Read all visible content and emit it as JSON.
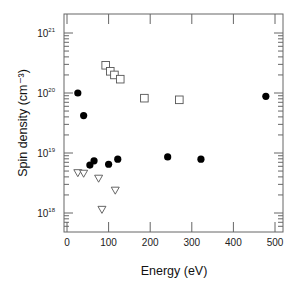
{
  "chart_data": {
    "type": "scatter",
    "title": "",
    "xlabel": "Energy (eV)",
    "ylabel": "Spin density (cm⁻³)",
    "xlim": [
      -10,
      510
    ],
    "ylim_log10": [
      17.7,
      21.3
    ],
    "yscale": "log",
    "grid": false,
    "legend": "none",
    "x_ticks": [
      0,
      100,
      200,
      300,
      400,
      500
    ],
    "y_ticks": [
      {
        "exp": 18,
        "label": "10",
        "sup": "18"
      },
      {
        "exp": 19,
        "label": "10",
        "sup": "19"
      },
      {
        "exp": 20,
        "label": "10",
        "sup": "20"
      },
      {
        "exp": 21,
        "label": "10",
        "sup": "21"
      }
    ],
    "series": [
      {
        "name": "filled-circles",
        "marker": "circle-filled",
        "color": "#000000",
        "points": [
          {
            "x": 26,
            "y": 1e+20
          },
          {
            "x": 40,
            "y": 4.2e+19
          },
          {
            "x": 55,
            "y": 6.3e+18
          },
          {
            "x": 65,
            "y": 7.4e+18
          },
          {
            "x": 100,
            "y": 6.5e+18
          },
          {
            "x": 122,
            "y": 7.9e+18
          },
          {
            "x": 242,
            "y": 8.6e+18
          },
          {
            "x": 322,
            "y": 7.9e+18
          },
          {
            "x": 478,
            "y": 8.8e+19
          }
        ]
      },
      {
        "name": "open-squares",
        "marker": "square-open",
        "color": "#555555",
        "points": [
          {
            "x": 93,
            "y": 2.9e+20
          },
          {
            "x": 104,
            "y": 2.3e+20
          },
          {
            "x": 114,
            "y": 2e+20
          },
          {
            "x": 128,
            "y": 1.7e+20
          },
          {
            "x": 186,
            "y": 8.2e+19
          },
          {
            "x": 270,
            "y": 7.7e+19
          }
        ]
      },
      {
        "name": "open-triangles",
        "marker": "triangle-down-open",
        "color": "#555555",
        "points": [
          {
            "x": 26,
            "y": 4.7e+18
          },
          {
            "x": 40,
            "y": 4.6e+18
          },
          {
            "x": 76,
            "y": 3.8e+18
          },
          {
            "x": 116,
            "y": 2.4e+18
          },
          {
            "x": 84,
            "y": 1.15e+18
          }
        ]
      }
    ]
  },
  "layout": {
    "frame": {
      "left": 64,
      "right": 283,
      "top": 14,
      "bottom": 232
    },
    "x0_px": 67,
    "px_per_unit_x": 0.416,
    "y18_px": 213,
    "px_per_decade": 60
  }
}
